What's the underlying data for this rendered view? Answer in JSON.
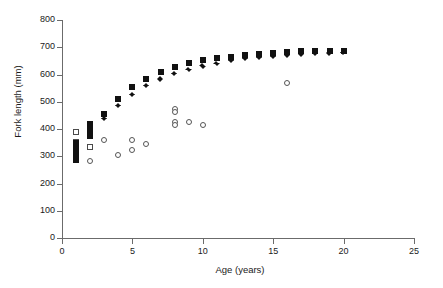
{
  "chart_data": {
    "type": "scatter",
    "title": "",
    "xlabel": "Age (years)",
    "ylabel": "Fork length (mm)",
    "xlim": [
      0,
      25
    ],
    "ylim": [
      0,
      800
    ],
    "xticks": [
      0,
      5,
      10,
      15,
      20,
      25
    ],
    "yticks": [
      0,
      100,
      200,
      300,
      400,
      500,
      600,
      700,
      800
    ],
    "xtick_labels": [
      "0",
      "5",
      "10",
      "15",
      "20",
      "25"
    ],
    "ytick_labels": [
      "0",
      "100",
      "200",
      "300",
      "400",
      "500",
      "600",
      "700",
      "800"
    ],
    "grid": false,
    "legend": "none",
    "series": [
      {
        "name": "filled-square",
        "marker": "filled square",
        "color": "#111111",
        "points": [
          {
            "x": 1,
            "y": 348
          },
          {
            "x": 1,
            "y": 335
          },
          {
            "x": 1,
            "y": 322
          },
          {
            "x": 1,
            "y": 310
          },
          {
            "x": 1,
            "y": 296
          },
          {
            "x": 1,
            "y": 285
          },
          {
            "x": 2,
            "y": 420
          },
          {
            "x": 2,
            "y": 408
          },
          {
            "x": 2,
            "y": 396
          },
          {
            "x": 2,
            "y": 382
          },
          {
            "x": 2,
            "y": 373
          },
          {
            "x": 3,
            "y": 455
          },
          {
            "x": 4,
            "y": 511
          },
          {
            "x": 5,
            "y": 554
          },
          {
            "x": 6,
            "y": 583
          },
          {
            "x": 7,
            "y": 611
          },
          {
            "x": 8,
            "y": 628
          },
          {
            "x": 9,
            "y": 642
          },
          {
            "x": 10,
            "y": 653
          },
          {
            "x": 11,
            "y": 662
          },
          {
            "x": 12,
            "y": 666
          },
          {
            "x": 13,
            "y": 672
          },
          {
            "x": 14,
            "y": 676
          },
          {
            "x": 15,
            "y": 680
          },
          {
            "x": 16,
            "y": 683
          },
          {
            "x": 17,
            "y": 685
          },
          {
            "x": 18,
            "y": 686
          },
          {
            "x": 19,
            "y": 686
          },
          {
            "x": 20,
            "y": 687
          }
        ]
      },
      {
        "name": "filled-diamond",
        "marker": "filled diamond",
        "color": "#111111",
        "points": [
          {
            "x": 3,
            "y": 438
          },
          {
            "x": 4,
            "y": 488
          },
          {
            "x": 5,
            "y": 527
          },
          {
            "x": 6,
            "y": 559
          },
          {
            "x": 7,
            "y": 584
          },
          {
            "x": 8,
            "y": 604
          },
          {
            "x": 9,
            "y": 620
          },
          {
            "x": 10,
            "y": 632
          },
          {
            "x": 11,
            "y": 642
          },
          {
            "x": 12,
            "y": 651
          },
          {
            "x": 13,
            "y": 658
          },
          {
            "x": 14,
            "y": 662
          },
          {
            "x": 15,
            "y": 668
          },
          {
            "x": 16,
            "y": 672
          },
          {
            "x": 17,
            "y": 676
          },
          {
            "x": 18,
            "y": 678
          },
          {
            "x": 19,
            "y": 680
          },
          {
            "x": 20,
            "y": 682
          }
        ]
      },
      {
        "name": "open-square",
        "marker": "open square",
        "color": "#ffffff",
        "points": [
          {
            "x": 1,
            "y": 388
          },
          {
            "x": 1,
            "y": 352
          },
          {
            "x": 1,
            "y": 340
          },
          {
            "x": 1,
            "y": 328
          },
          {
            "x": 1,
            "y": 316
          },
          {
            "x": 2,
            "y": 418
          },
          {
            "x": 2,
            "y": 406
          },
          {
            "x": 2,
            "y": 394
          },
          {
            "x": 2,
            "y": 334
          }
        ]
      },
      {
        "name": "open-circle",
        "marker": "open circle",
        "color": "#ffffff",
        "points": [
          {
            "x": 2,
            "y": 282
          },
          {
            "x": 3,
            "y": 360
          },
          {
            "x": 4,
            "y": 304
          },
          {
            "x": 5,
            "y": 359
          },
          {
            "x": 5,
            "y": 323
          },
          {
            "x": 6,
            "y": 345
          },
          {
            "x": 8,
            "y": 472
          },
          {
            "x": 8,
            "y": 461
          },
          {
            "x": 8,
            "y": 426
          },
          {
            "x": 8,
            "y": 415
          },
          {
            "x": 9,
            "y": 425
          },
          {
            "x": 10,
            "y": 415
          },
          {
            "x": 16,
            "y": 568
          }
        ]
      }
    ]
  }
}
